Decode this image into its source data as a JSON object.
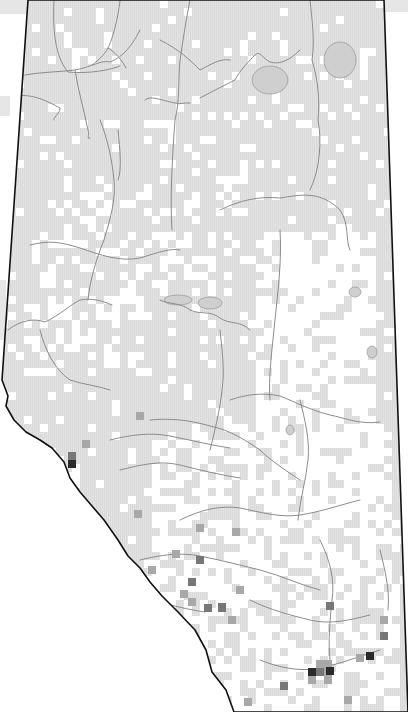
{
  "map": {
    "region": "Alberta",
    "width": 408,
    "height": 712,
    "colors": {
      "background": "#ffffff",
      "outside_strip": "#e6e6e6",
      "cell_fill": "#e2e2e2",
      "cell_hatch": "#d6d6d6",
      "border": "#111111",
      "river": "#8c8c8c",
      "lake": "#cfcfcf",
      "cell_medium": "#a8a8a8",
      "cell_dark": "#777777",
      "cell_darkest": "#2a2a2a"
    },
    "grid_cell_size": 8,
    "outline": [
      [
        28,
        0
      ],
      [
        384,
        0
      ],
      [
        408,
        712
      ],
      [
        234,
        712
      ],
      [
        226,
        690
      ],
      [
        212,
        672
      ],
      [
        206,
        650
      ],
      [
        195,
        630
      ],
      [
        178,
        612
      ],
      [
        162,
        596
      ],
      [
        150,
        582
      ],
      [
        140,
        568
      ],
      [
        128,
        556
      ],
      [
        118,
        540
      ],
      [
        104,
        520
      ],
      [
        92,
        506
      ],
      [
        80,
        492
      ],
      [
        70,
        478
      ],
      [
        64,
        462
      ],
      [
        52,
        448
      ],
      [
        40,
        440
      ],
      [
        26,
        432
      ],
      [
        14,
        420
      ],
      [
        6,
        406
      ],
      [
        8,
        396
      ],
      [
        2,
        380
      ],
      [
        28,
        0
      ]
    ],
    "rivers": [
      "M54,0 C52,40 58,60 68,72 C90,74 110,70 120,66",
      "M25,75 C40,72 60,72 75,70 C95,66 100,60 110,62 C120,58 130,50 140,30",
      "M120,0 C118,20 112,40 108,48 C104,56 96,62 92,65",
      "M108,48 C115,52 122,60 126,68",
      "M10,97 C30,92 45,100 60,108 C60,114 52,118 54,120",
      "M75,70 C78,90 84,110 88,130 C90,135 86,140 90,138",
      "M118,130 C120,150 122,170 118,180",
      "M145,100 C150,95 160,100 175,103 C180,105 185,102 190,103",
      "M300,50 C290,60 280,65 270,62 C262,58 260,50 255,55 C250,60 240,70 235,80 C225,85 215,90 200,98",
      "M310,0 C312,20 315,40 312,60 C318,80 320,100 318,120 C322,140 320,170 310,190",
      "M160,40 C180,50 190,60 200,70 C210,65 220,58 230,60",
      "M190,0 C186,20 183,40 180,60 C178,80 180,100 175,120 C172,160 170,200 172,230",
      "M30,245 C50,240 60,242 80,248 C100,255 120,262 140,258 C160,252 170,248 180,250",
      "M100,120 C108,140 112,160 114,180 C116,200 110,220 104,240 C96,260 90,280 88,300",
      "M220,210 C240,200 260,196 280,198 C300,195 320,190 340,210 C350,225 345,240 350,250",
      "M280,230 C282,260 278,290 275,320 C272,350 268,380 270,400",
      "M160,300 C170,305 180,302 190,310 C200,315 210,310 220,318 C230,325 240,320 250,330",
      "M8,330 C20,320 35,318 45,322 C60,315 70,305 80,300 C92,298 100,300 112,305",
      "M40,330 C45,350 55,370 70,380 C85,385 95,385 110,390",
      "M230,400 C245,395 260,392 280,396 C295,402 310,410 330,415 C345,418 360,425 380,422",
      "M150,420 C170,418 190,420 210,426 C230,430 245,440 260,450 C270,460 285,470 300,480",
      "M110,440 C130,435 150,432 170,436 C190,440 210,445 230,448",
      "M120,470 C140,465 160,460 180,465 C200,470 220,475 240,478",
      "M220,330 C222,350 225,370 222,390 C220,410 215,430 210,450",
      "M300,400 C305,420 310,440 308,460 C306,480 300,500 298,520",
      "M140,560 C160,555 180,552 200,556 C220,560 240,565 260,570 C280,575 300,585 320,590",
      "M180,520 C200,510 220,505 240,508 C260,512 280,518 300,515 C320,512 340,505 360,500",
      "M250,600 C270,610 290,615 310,620 C330,625 350,620 370,615",
      "M260,660 C280,668 300,672 320,668 C340,664 360,656 380,650",
      "M150,600 C170,605 190,610 205,612",
      "M320,540 C330,560 335,580 332,600 C330,620 328,640 330,660",
      "M380,550 C385,570 390,590 388,610"
    ],
    "lakes": [
      {
        "cx": 270,
        "cy": 80,
        "rx": 18,
        "ry": 14
      },
      {
        "cx": 340,
        "cy": 60,
        "rx": 16,
        "ry": 18
      },
      {
        "cx": 178,
        "cy": 300,
        "rx": 14,
        "ry": 5
      },
      {
        "cx": 210,
        "cy": 303,
        "rx": 12,
        "ry": 6
      },
      {
        "cx": 355,
        "cy": 292,
        "rx": 6,
        "ry": 5
      },
      {
        "cx": 372,
        "cy": 352,
        "rx": 5,
        "ry": 6
      },
      {
        "cx": 290,
        "cy": 430,
        "rx": 4,
        "ry": 5
      }
    ],
    "white_zones": [
      {
        "x": 250,
        "y": 230,
        "w": 120,
        "h": 200,
        "density": 0.75
      },
      {
        "x": 240,
        "y": 420,
        "w": 150,
        "h": 150,
        "density": 0.7
      },
      {
        "x": 20,
        "y": 290,
        "w": 120,
        "h": 80,
        "density": 0.45
      },
      {
        "x": 150,
        "y": 420,
        "w": 90,
        "h": 100,
        "density": 0.45
      },
      {
        "x": 150,
        "y": 520,
        "w": 250,
        "h": 190,
        "density": 0.6
      },
      {
        "x": 30,
        "y": 200,
        "w": 200,
        "h": 90,
        "density": 0.35
      }
    ],
    "base_white_density": 0.12,
    "dark_cells": [
      {
        "x": 68,
        "y": 460,
        "shade": "cell_darkest"
      },
      {
        "x": 68,
        "y": 452,
        "shade": "cell_dark"
      },
      {
        "x": 82,
        "y": 440,
        "shade": "cell_medium"
      },
      {
        "x": 172,
        "y": 550,
        "shade": "cell_medium"
      },
      {
        "x": 196,
        "y": 556,
        "shade": "cell_dark"
      },
      {
        "x": 188,
        "y": 578,
        "shade": "cell_dark"
      },
      {
        "x": 180,
        "y": 590,
        "shade": "cell_medium"
      },
      {
        "x": 188,
        "y": 598,
        "shade": "cell_medium"
      },
      {
        "x": 204,
        "y": 604,
        "shade": "cell_dark"
      },
      {
        "x": 148,
        "y": 566,
        "shade": "cell_medium"
      },
      {
        "x": 218,
        "y": 604,
        "shade": "cell_dark"
      },
      {
        "x": 236,
        "y": 586,
        "shade": "cell_medium"
      },
      {
        "x": 228,
        "y": 616,
        "shade": "cell_medium"
      },
      {
        "x": 218,
        "y": 603,
        "shade": "cell_dark"
      },
      {
        "x": 326,
        "y": 602,
        "shade": "cell_dark"
      },
      {
        "x": 380,
        "y": 632,
        "shade": "cell_dark"
      },
      {
        "x": 380,
        "y": 616,
        "shade": "cell_medium"
      },
      {
        "x": 316,
        "y": 660,
        "shade": "cell_medium"
      },
      {
        "x": 324,
        "y": 660,
        "shade": "cell_medium"
      },
      {
        "x": 316,
        "y": 668,
        "shade": "cell_dark"
      },
      {
        "x": 324,
        "y": 668,
        "shade": "cell_medium"
      },
      {
        "x": 308,
        "y": 668,
        "shade": "cell_darkest"
      },
      {
        "x": 326,
        "y": 667,
        "shade": "cell_darkest"
      },
      {
        "x": 308,
        "y": 676,
        "shade": "cell_medium"
      },
      {
        "x": 324,
        "y": 676,
        "shade": "cell_medium"
      },
      {
        "x": 366,
        "y": 652,
        "shade": "cell_darkest"
      },
      {
        "x": 356,
        "y": 654,
        "shade": "cell_medium"
      },
      {
        "x": 280,
        "y": 682,
        "shade": "cell_dark"
      },
      {
        "x": 244,
        "y": 698,
        "shade": "cell_medium"
      },
      {
        "x": 344,
        "y": 696,
        "shade": "cell_medium"
      },
      {
        "x": 216,
        "y": 688,
        "shade": "cell_medium"
      },
      {
        "x": 136,
        "y": 412,
        "shade": "cell_medium"
      },
      {
        "x": 134,
        "y": 510,
        "shade": "cell_medium"
      },
      {
        "x": 196,
        "y": 524,
        "shade": "cell_medium"
      },
      {
        "x": 232,
        "y": 528,
        "shade": "cell_medium"
      }
    ],
    "outside_strips": [
      {
        "x": 0,
        "y": 0,
        "w": 28,
        "h": 14
      },
      {
        "x": 384,
        "y": 0,
        "w": 24,
        "h": 12
      },
      {
        "x": 0,
        "y": 96,
        "w": 10,
        "h": 20
      },
      {
        "x": 0,
        "y": 280,
        "w": 6,
        "h": 60
      }
    ]
  }
}
